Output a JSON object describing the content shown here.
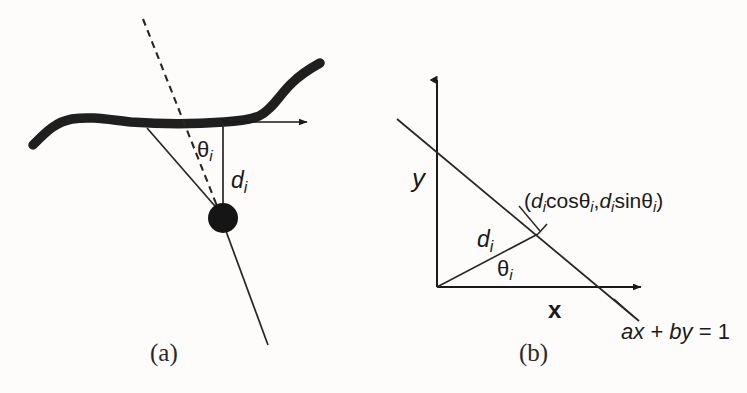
{
  "figure": {
    "background_color": "#fdfcfb",
    "ink_color": "#1a1a1a",
    "panels": [
      {
        "id": "a",
        "caption": "(a)",
        "description": "A thick curved contour with a point below it; the perpendicular distance d_i and angle theta_i to a dashed normal direction are marked.",
        "labels": {
          "angle": "θ",
          "angle_sub": "i",
          "distance": "d",
          "distance_sub": "i"
        }
      },
      {
        "id": "b",
        "caption": "(b)",
        "description": "Cartesian x-y axes with a line ax + by = 1 crossing them; the foot point at distance d_i and angle theta_i from the origin is labelled.",
        "labels": {
          "y_axis": "y",
          "x_axis": "x",
          "distance": "d",
          "distance_sub": "i",
          "angle": "θ",
          "angle_sub": "i",
          "point_open": "(",
          "point_d1": "d",
          "point_sub1": "i",
          "point_cos": "cosθ",
          "point_sub2": "i",
          "point_comma": ",",
          "point_d2": "d",
          "point_sub3": "i",
          "point_sin": "sinθ",
          "point_sub4": "i",
          "point_close": ")",
          "line_eq_a": "a",
          "line_eq_x": "x",
          "line_eq_plus": "+",
          "line_eq_b": "b",
          "line_eq_y": "y",
          "line_eq_rest": "= 1"
        }
      }
    ]
  }
}
